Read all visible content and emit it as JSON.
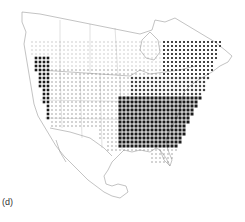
{
  "figure": {
    "panel_label": "(d)",
    "colors": {
      "outline": "#9a9a9a",
      "dot_dark": "#1a1a1a",
      "dot_medium": "#444444",
      "dot_light": "#888888",
      "background": "#ffffff"
    },
    "density_regions": [
      {
        "name": "eastern-us-core",
        "density": "high"
      },
      {
        "name": "pacific-coast",
        "density": "high"
      },
      {
        "name": "great-plains",
        "density": "low"
      },
      {
        "name": "southern-canada",
        "density": "low"
      },
      {
        "name": "northeast",
        "density": "medium"
      }
    ]
  }
}
